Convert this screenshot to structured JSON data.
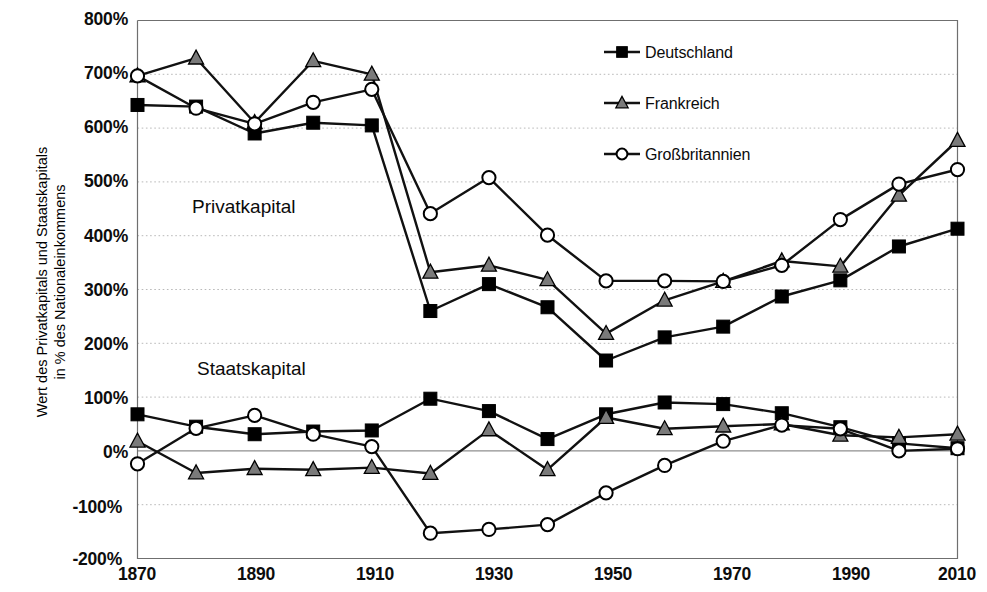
{
  "chart_data": {
    "type": "line",
    "title": "",
    "xlabel": "",
    "ylabel": "Wert des Privatkapitals und Staatskapitals in % des Nationaleinkommens",
    "ylabel_line1": "Wert des Privatkapitals und Staatskapitals",
    "ylabel_line2": "in % des Nationaleinkommens",
    "x": [
      1870,
      1880,
      1890,
      1900,
      1910,
      1920,
      1930,
      1940,
      1950,
      1960,
      1970,
      1980,
      1990,
      2000,
      2010
    ],
    "xlim": [
      1870,
      2010
    ],
    "ylim": [
      -200,
      800
    ],
    "ytick_values": [
      800,
      700,
      600,
      500,
      400,
      300,
      200,
      100,
      0,
      -100,
      -200
    ],
    "ytick_labels": [
      "800%",
      "700%",
      "600%",
      "500%",
      "400%",
      "300%",
      "200%",
      "100%",
      "0%",
      "-100%",
      "-200%"
    ],
    "xtick_values": [
      1870,
      1890,
      1910,
      1930,
      1950,
      1970,
      1990,
      2010
    ],
    "xtick_labels": [
      "1870",
      "1890",
      "1910",
      "1930",
      "1950",
      "1970",
      "1990",
      "2010"
    ],
    "grid": "horizontal-dotted",
    "zero_line": true,
    "legend_position": "top-right",
    "annotations": [
      {
        "text": "Privatkapital",
        "x": 1883,
        "y": 448
      },
      {
        "text": "Staatskapital",
        "x": 1883,
        "y": 150
      }
    ],
    "groups": [
      {
        "name": "Privatkapital",
        "series": [
          {
            "name": "Deutschland",
            "marker": "filled-square",
            "color": "#000000",
            "values": [
              643,
              640,
              590,
              610,
              605,
              260,
              310,
              267,
              168,
              211,
              231,
              287,
              317,
              380,
              413
            ]
          },
          {
            "name": "Frankreich",
            "marker": "gray-triangle",
            "color": "#000000",
            "values": [
              697,
              730,
              610,
              725,
              700,
              332,
              345,
              318,
              218,
              280,
              315,
              353,
              343,
              475,
              577
            ]
          },
          {
            "name": "Großbritannien",
            "marker": "open-circle",
            "color": "#000000",
            "values": [
              697,
              637,
              608,
              648,
              672,
              441,
              508,
              401,
              316,
              316,
              315,
              345,
              430,
              496,
              523
            ]
          }
        ]
      },
      {
        "name": "Staatskapital",
        "series": [
          {
            "name": "Deutschland",
            "marker": "filled-square",
            "color": "#000000",
            "values": [
              68,
              45,
              31,
              36,
              38,
              97,
              74,
              22,
              68,
              90,
              87,
              70,
              44,
              14,
              5
            ]
          },
          {
            "name": "Frankreich",
            "marker": "gray-triangle",
            "color": "#000000",
            "values": [
              18,
              -41,
              -33,
              -35,
              -31,
              -42,
              39,
              -35,
              62,
              41,
              46,
              50,
              29,
              25,
              31
            ]
          },
          {
            "name": "Großbritannien",
            "marker": "open-circle",
            "color": "#000000",
            "values": [
              -24,
              42,
              66,
              31,
              8,
              -153,
              -146,
              -137,
              -78,
              -27,
              18,
              48,
              41,
              0,
              4
            ]
          }
        ]
      }
    ],
    "legend": [
      {
        "label": "Deutschland",
        "marker": "filled-square"
      },
      {
        "label": "Frankreich",
        "marker": "gray-triangle"
      },
      {
        "label": "Großbritannien",
        "marker": "open-circle"
      }
    ],
    "colors": {
      "line": "#111111",
      "grid": "#b9b9b9",
      "zero_line": "#8f8f8f",
      "axis": "#6f6f6f",
      "triangle_fill": "#7a7a7a",
      "square_fill": "#000000",
      "circle_fill": "#ffffff",
      "background": "#ffffff"
    }
  }
}
